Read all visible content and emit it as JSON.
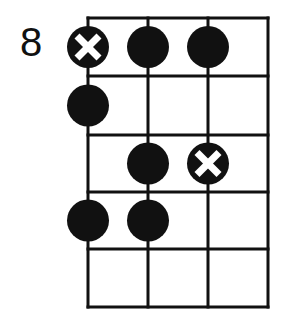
{
  "diagram": {
    "type": "fretboard-scale-diagram",
    "start_fret_label": "8",
    "strings": 4,
    "frets": 5,
    "colors": {
      "line": "#111111",
      "dot": "#111111",
      "root_marker_cross": "#ffffff",
      "background": "#ffffff"
    },
    "grid": {
      "string_x": [
        88,
        148,
        208,
        268
      ],
      "fret_y": [
        18,
        76,
        135,
        192,
        249,
        307
      ],
      "dot_radius": 21
    },
    "notes": [
      {
        "string": 1,
        "fret": 1,
        "type": "root",
        "icon": "root-cross-dot"
      },
      {
        "string": 2,
        "fret": 1,
        "type": "note",
        "icon": "filled-dot"
      },
      {
        "string": 3,
        "fret": 1,
        "type": "note",
        "icon": "filled-dot"
      },
      {
        "string": 1,
        "fret": 2,
        "type": "note",
        "icon": "filled-dot"
      },
      {
        "string": 2,
        "fret": 3,
        "type": "note",
        "icon": "filled-dot"
      },
      {
        "string": 3,
        "fret": 3,
        "type": "root",
        "icon": "root-cross-dot"
      },
      {
        "string": 1,
        "fret": 4,
        "type": "note",
        "icon": "filled-dot"
      },
      {
        "string": 2,
        "fret": 4,
        "type": "note",
        "icon": "filled-dot"
      }
    ]
  }
}
